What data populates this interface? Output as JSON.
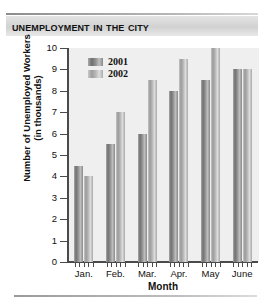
{
  "chart_title": "Unemployment in the City",
  "axis": {
    "y_title": "Number of Unemployed Workers\n(in thousands)",
    "y_title_line1": "Number of Unemployed Workers",
    "y_title_line2": "(in thousands)",
    "x_title": "Month",
    "y_ticks": [
      "0",
      "1",
      "2",
      "3",
      "4",
      "5",
      "6",
      "7",
      "8",
      "9",
      "10"
    ]
  },
  "legend": {
    "entries": [
      {
        "label": "2001",
        "color": "#7a7a7a"
      },
      {
        "label": "2002",
        "color": "#b4b4b4"
      }
    ]
  },
  "chart_data": {
    "type": "bar",
    "title": "Unemployment in the City",
    "xlabel": "Month",
    "ylabel": "Number of Unemployed Workers (in thousands)",
    "categories": [
      "Jan.",
      "Feb.",
      "Mar.",
      "Apr.",
      "May",
      "June"
    ],
    "series": [
      {
        "name": "2001",
        "color": "#7a7a7a",
        "values": [
          4.5,
          5.5,
          6.0,
          8.0,
          8.5,
          9.0
        ]
      },
      {
        "name": "2002",
        "color": "#b4b4b4",
        "values": [
          4.0,
          7.0,
          8.5,
          9.5,
          10.0,
          9.0
        ]
      }
    ],
    "ylim": [
      0,
      10
    ],
    "ytick_step": 1,
    "grid": false,
    "legend_position": "top-left-inside"
  }
}
